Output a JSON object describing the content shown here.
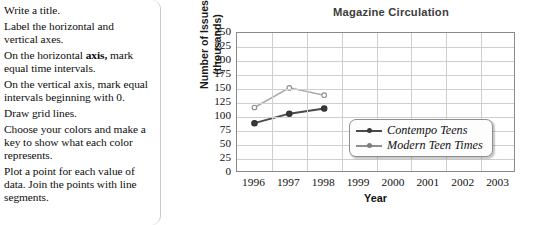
{
  "instructions": {
    "items": [
      "Write a title.",
      "Label the horizontal and vertical axes.",
      "On the horizontal axis, mark equal time intervals.",
      "On the vertical axis, mark equal intervals beginning with 0.",
      "Draw grid lines.",
      "Choose your colors and make a key to show what each color represents.",
      "Plot a point for each value of data. Join the points with line segments."
    ]
  },
  "chart_data": {
    "type": "line",
    "title": "Magazine Circulation",
    "xlabel": "Year",
    "ylabel": "Number of Issues (thousands)",
    "ylabel_line1": "Number of Issues",
    "ylabel_line2": "(thousands)",
    "categories": [
      "1996",
      "1997",
      "1998",
      "1999",
      "2000",
      "2001",
      "2002",
      "2003"
    ],
    "x_tick_labels": [
      "1996",
      "1997",
      "1998",
      "1999",
      "2000",
      "2001",
      "2002",
      "2003"
    ],
    "y_tick_labels": [
      "250",
      "225",
      "200",
      "175",
      "150",
      "125",
      "100",
      "75",
      "50",
      "25",
      "0"
    ],
    "ylim": [
      0,
      250
    ],
    "y_tick_step": 25,
    "grid": true,
    "legend_position": "inside-lower-right",
    "series": [
      {
        "name": "Contempo Teens",
        "color": "#4a4a4a",
        "x": [
          "1996",
          "1997",
          "1998"
        ],
        "values": [
          89,
          106,
          115
        ]
      },
      {
        "name": "Modern Teen Times",
        "color": "#aaaaaa",
        "x": [
          "1996",
          "1997",
          "1998"
        ],
        "values": [
          117,
          152,
          139
        ]
      }
    ]
  },
  "colors": {
    "series_dark": "#4a4a4a",
    "series_light": "#aaaaaa",
    "grid": "#cfcfcf",
    "axis": "#8a8a8a",
    "title": "#3c3c3c"
  }
}
